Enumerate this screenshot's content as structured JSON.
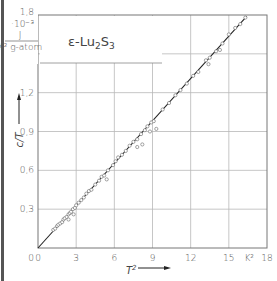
{
  "chart_data": {
    "type": "scatter",
    "title_parts": {
      "prefix": "ε-Lu",
      "sub1": "2",
      "mid": "S",
      "sub2": "3"
    },
    "xlabel": "T²",
    "x_unit": "K²",
    "ylabel": "c/T",
    "y_unit_lines": [
      "·10⁻³",
      "J",
      "K² g-atom"
    ],
    "y_scale_label": "1,8",
    "xlim": [
      0,
      18
    ],
    "ylim": [
      0,
      1.8
    ],
    "x_ticks": [
      0,
      3,
      6,
      9,
      12,
      15,
      18
    ],
    "x_tick_labels": [
      "0",
      "3",
      "6",
      "9",
      "12",
      "15",
      "K²",
      "18"
    ],
    "y_ticks": [
      0,
      0.3,
      0.6,
      0.9,
      1.2,
      1.5,
      1.8
    ],
    "y_tick_labels": [
      "0",
      "0,3",
      "0,6",
      "0,9",
      "1,2",
      "",
      "1,8"
    ],
    "grid": true,
    "fit_line": {
      "x": [
        0,
        16.4
      ],
      "y": [
        0,
        1.79
      ],
      "slope": 0.109
    },
    "series": [
      {
        "name": "measured",
        "marker": "open-circle",
        "points": [
          [
            1.2,
            0.14
          ],
          [
            1.35,
            0.15
          ],
          [
            1.5,
            0.17
          ],
          [
            1.6,
            0.18
          ],
          [
            1.75,
            0.19
          ],
          [
            1.9,
            0.2
          ],
          [
            2.0,
            0.22
          ],
          [
            2.1,
            0.23
          ],
          [
            2.25,
            0.24
          ],
          [
            2.4,
            0.26
          ],
          [
            2.5,
            0.27
          ],
          [
            2.6,
            0.28
          ],
          [
            2.75,
            0.3
          ],
          [
            2.9,
            0.31
          ],
          [
            3.0,
            0.33
          ],
          [
            3.2,
            0.35
          ],
          [
            2.4,
            0.22
          ],
          [
            2.8,
            0.26
          ],
          [
            3.4,
            0.37
          ],
          [
            3.6,
            0.39
          ],
          [
            3.8,
            0.42
          ],
          [
            4.0,
            0.44
          ],
          [
            4.2,
            0.45
          ],
          [
            4.5,
            0.49
          ],
          [
            4.8,
            0.52
          ],
          [
            5.0,
            0.55
          ],
          [
            5.2,
            0.56
          ],
          [
            5.5,
            0.6
          ],
          [
            5.4,
            0.53
          ],
          [
            5.9,
            0.64
          ],
          [
            6.1,
            0.67
          ],
          [
            6.3,
            0.7
          ],
          [
            6.6,
            0.72
          ],
          [
            6.9,
            0.75
          ],
          [
            7.2,
            0.79
          ],
          [
            7.5,
            0.82
          ],
          [
            7.8,
            0.84
          ],
          [
            8.1,
            0.88
          ],
          [
            8.4,
            0.91
          ],
          [
            8.6,
            0.94
          ],
          [
            8.9,
            0.97
          ],
          [
            9.1,
            0.98
          ],
          [
            8.8,
            0.9
          ],
          [
            9.3,
            0.92
          ],
          [
            8.2,
            0.8
          ],
          [
            7.8,
            0.78
          ],
          [
            9.8,
            1.07
          ],
          [
            10.3,
            1.12
          ],
          [
            10.8,
            1.18
          ],
          [
            11.2,
            1.22
          ],
          [
            11.7,
            1.27
          ],
          [
            12.2,
            1.33
          ],
          [
            12.6,
            1.36
          ],
          [
            13.2,
            1.45
          ],
          [
            13.5,
            1.47
          ],
          [
            14.0,
            1.52
          ],
          [
            14.5,
            1.58
          ],
          [
            15.0,
            1.65
          ],
          [
            15.5,
            1.7
          ],
          [
            15.9,
            1.73
          ],
          [
            16.3,
            1.78
          ],
          [
            13.4,
            1.42
          ],
          [
            14.3,
            1.53
          ]
        ]
      }
    ],
    "legend": null
  }
}
